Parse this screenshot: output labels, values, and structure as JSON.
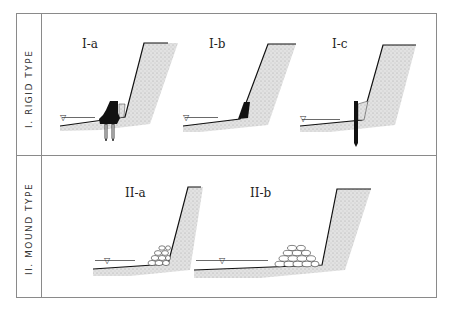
{
  "sections": [
    {
      "label": "I. RIGID TYPE",
      "panels": [
        {
          "id": "I-a",
          "label": "I-a",
          "feature": "concrete block on piles"
        },
        {
          "id": "I-b",
          "label": "I-b",
          "feature": "concrete toe block"
        },
        {
          "id": "I-c",
          "label": "I-c",
          "feature": "sheet pile"
        }
      ]
    },
    {
      "label": "II. MOUND TYPE",
      "panels": [
        {
          "id": "II-a",
          "label": "II-a",
          "feature": "small rubble mound"
        },
        {
          "id": "II-b",
          "label": "II-b",
          "feature": "wide rubble mound"
        }
      ]
    }
  ],
  "water_symbol": "▽",
  "colors": {
    "frame": "#888888",
    "ink": "#111111",
    "fill": "#d8d8d8"
  }
}
